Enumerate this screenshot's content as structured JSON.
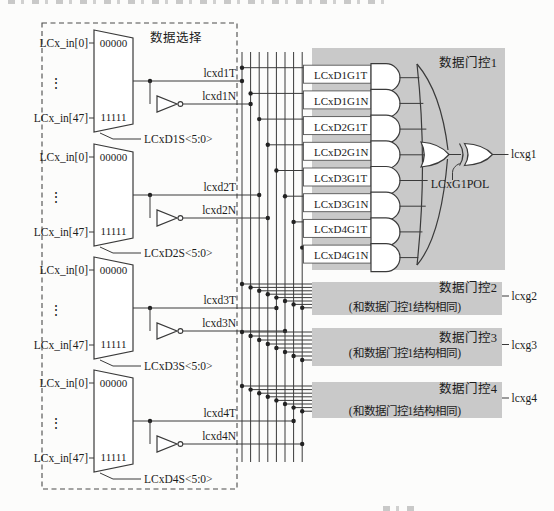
{
  "selection": {
    "title": "数据选择",
    "muxes": [
      {
        "in_top": "LCx_in[0]",
        "in_bottom": "LCx_in[47]",
        "ellipsis": "⋮",
        "code_top": "00000",
        "code_bottom": "11111",
        "select": "LCxD1S<5:0>",
        "out_t": "lcxd1T",
        "out_n": "lcxd1N"
      },
      {
        "in_top": "LCx_in[0]",
        "in_bottom": "LCx_in[47]",
        "ellipsis": "⋮",
        "code_top": "00000",
        "code_bottom": "11111",
        "select": "LCxD2S<5:0>",
        "out_t": "lcxd2T",
        "out_n": "lcxd2N"
      },
      {
        "in_top": "LCx_in[0]",
        "in_bottom": "LCx_in[47]",
        "ellipsis": "⋮",
        "code_top": "00000",
        "code_bottom": "11111",
        "select": "LCxD3S<5:0>",
        "out_t": "lcxd3T",
        "out_n": "lcxd3N"
      },
      {
        "in_top": "LCx_in[0]",
        "in_bottom": "LCx_in[47]",
        "ellipsis": "⋮",
        "code_top": "00000",
        "code_bottom": "11111",
        "select": "LCxD4S<5:0>",
        "out_t": "lcxd4T",
        "out_n": "lcxd4N"
      }
    ]
  },
  "gating1": {
    "title": "数据门控1",
    "inputs": [
      "LCxD1G1T",
      "LCxD1G1N",
      "LCxD2G1T",
      "LCxD2G1N",
      "LCxD3G1T",
      "LCxD3G1N",
      "LCxD4G1T",
      "LCxD4G1N"
    ],
    "pol": "LCxG1POL",
    "output": "lcxg1"
  },
  "gating_blocks": [
    {
      "title": "数据门控2",
      "note": "(和数据门控1结构相同)",
      "output": "lcxg2"
    },
    {
      "title": "数据门控3",
      "note": "(和数据门控1结构相同)",
      "output": "lcxg3"
    },
    {
      "title": "数据门控4",
      "note": "(和数据门控1结构相同)",
      "output": "lcxg4"
    }
  ],
  "colors": {
    "line": "#3a3a3a",
    "box_fill": "#c9c9c9",
    "shape_fill": "#ffffff",
    "text": "#1c1c1c",
    "bg": "#fcfcfb"
  }
}
